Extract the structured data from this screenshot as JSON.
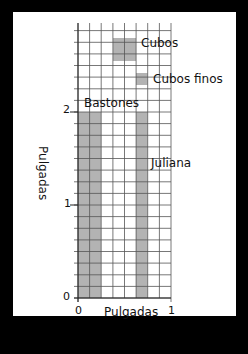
{
  "diagram": {
    "title": "",
    "x_axis": {
      "label": "Pulgadas",
      "ticks": [
        "0",
        "1"
      ]
    },
    "y_axis": {
      "label": "Pulgadas",
      "ticks": [
        "0",
        "1",
        "2"
      ]
    },
    "grid": {
      "divisions_per_inch": 8,
      "x_range": [
        0,
        1
      ],
      "y_range": [
        0,
        2.94
      ]
    },
    "cuts": [
      {
        "name": "Bastones",
        "x": [
          0,
          0.375
        ],
        "y": [
          0,
          2
        ]
      },
      {
        "name": "Juliana",
        "x": [
          0.625,
          0.75
        ],
        "y": [
          0,
          2
        ]
      },
      {
        "name": "Cubos",
        "x": [
          0.375,
          0.625
        ],
        "y": [
          2.5,
          2.75
        ]
      },
      {
        "name": "Cubos finos",
        "x": [
          0.625,
          0.75
        ],
        "y": [
          2.25,
          2.375
        ]
      }
    ],
    "colors": {
      "background": "#000000",
      "panel": "#ffffff",
      "fill": "#b3b3b3",
      "grid": "#555555"
    }
  },
  "labels": {
    "cubos": "Cubos",
    "cubos_finos": "Cubos finos",
    "bastones": "Bastones",
    "juliana": "Juliana",
    "x_axis": "Pulgadas",
    "y_axis": "Pulgadas",
    "x0": "0",
    "x1": "1",
    "y0": "0",
    "y1": "1",
    "y2": "2"
  }
}
